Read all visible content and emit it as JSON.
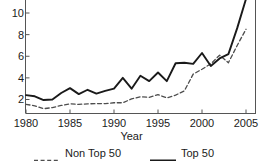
{
  "chart_data": {
    "type": "line",
    "title": "",
    "xlabel": "Year",
    "ylabel": "",
    "xlim": [
      1980,
      2005
    ],
    "ylim": [
      0.6,
      11.4
    ],
    "grid": false,
    "legend_position": "bottom",
    "x_ticks": [
      "1980",
      "1985",
      "1990",
      "1995",
      "2000",
      "2005"
    ],
    "x_tick_values": [
      1980,
      1985,
      1990,
      1995,
      2000,
      2005
    ],
    "y_ticks": [
      "2",
      "4",
      "6",
      "8",
      "10"
    ],
    "y_tick_values": [
      2,
      4,
      6,
      8,
      10
    ],
    "x": [
      1980,
      1981,
      1982,
      1983,
      1984,
      1985,
      1986,
      1987,
      1988,
      1989,
      1990,
      1991,
      1992,
      1993,
      1994,
      1995,
      1996,
      1997,
      1998,
      1999,
      2000,
      2001,
      2002,
      2003,
      2004,
      2005
    ],
    "series": [
      {
        "name": "Non Top 50",
        "style": "dashed",
        "color": "#4d4d4d",
        "values": [
          1.55,
          1.42,
          1.15,
          1.25,
          1.45,
          1.6,
          1.55,
          1.6,
          1.62,
          1.62,
          1.7,
          1.7,
          2.05,
          2.25,
          2.2,
          2.45,
          2.15,
          2.4,
          2.8,
          4.35,
          4.8,
          5.3,
          6.1,
          5.4,
          7.0,
          8.5
        ]
      },
      {
        "name": "Top 50",
        "style": "solid",
        "color": "#1a1a1a",
        "values": [
          2.4,
          2.3,
          1.95,
          2.0,
          2.6,
          3.05,
          2.5,
          2.9,
          2.55,
          2.8,
          3.0,
          4.0,
          3.0,
          4.2,
          3.7,
          4.5,
          3.7,
          5.35,
          5.4,
          5.3,
          6.3,
          5.1,
          5.8,
          6.2,
          8.6,
          11.3
        ]
      }
    ]
  },
  "legend": {
    "entries": [
      {
        "label": "Non Top 50",
        "style": "dashed"
      },
      {
        "label": "Top 50",
        "style": "solid"
      }
    ]
  }
}
